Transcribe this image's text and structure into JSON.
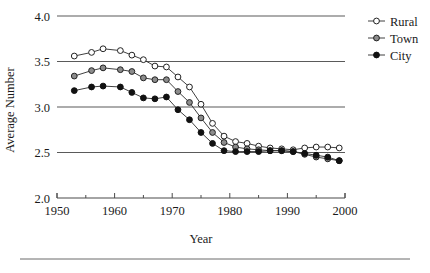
{
  "figure": {
    "y_axis_label": "Average Number",
    "x_axis_label": "Year",
    "y_ticks": [
      "2.0",
      "2.5",
      "3.0",
      "3.5",
      "4.0"
    ],
    "x_ticks": [
      "1950",
      "1960",
      "1970",
      "1980",
      "1990",
      "2000"
    ]
  },
  "legend": {
    "position": "right",
    "entries": [
      {
        "label": "Rural",
        "marker": "open-circle",
        "color": "#ffffff"
      },
      {
        "label": "Town",
        "marker": "gray-circle",
        "color": "#8c8c8c"
      },
      {
        "label": "City",
        "marker": "filled-circle",
        "color": "#111111"
      }
    ]
  },
  "chart_data": {
    "type": "line",
    "title": "",
    "xlabel": "Year",
    "ylabel": "Average Number",
    "xlim": [
      1950,
      2000
    ],
    "ylim": [
      2.0,
      4.0
    ],
    "yticks": [
      2.0,
      2.5,
      3.0,
      3.5,
      4.0
    ],
    "xticks": [
      1950,
      1960,
      1970,
      1980,
      1990,
      2000
    ],
    "xticks_minor": [
      1955,
      1965,
      1975,
      1985,
      1995
    ],
    "grid": "horizontal",
    "legend_position": "right",
    "series": [
      {
        "name": "Rural",
        "marker": "open-circle",
        "x": [
          1953,
          1956,
          1958,
          1961,
          1963,
          1965,
          1967,
          1969,
          1971,
          1973,
          1975,
          1977,
          1979,
          1981,
          1983,
          1985,
          1987,
          1989,
          1991,
          1993,
          1995,
          1997,
          1999
        ],
        "y": [
          3.56,
          3.6,
          3.64,
          3.62,
          3.57,
          3.52,
          3.45,
          3.44,
          3.33,
          3.22,
          3.03,
          2.82,
          2.68,
          2.62,
          2.6,
          2.57,
          2.55,
          2.54,
          2.53,
          2.55,
          2.56,
          2.56,
          2.55
        ]
      },
      {
        "name": "Town",
        "marker": "gray-circle",
        "x": [
          1953,
          1956,
          1958,
          1961,
          1963,
          1965,
          1967,
          1969,
          1971,
          1973,
          1975,
          1977,
          1979,
          1981,
          1983,
          1985,
          1987,
          1989,
          1991,
          1993,
          1995,
          1997,
          1999
        ],
        "y": [
          3.34,
          3.4,
          3.43,
          3.41,
          3.39,
          3.32,
          3.3,
          3.3,
          3.17,
          3.05,
          2.88,
          2.72,
          2.61,
          2.56,
          2.54,
          2.53,
          2.52,
          2.52,
          2.51,
          2.48,
          2.45,
          2.43,
          2.41
        ]
      },
      {
        "name": "City",
        "marker": "filled-circle",
        "x": [
          1953,
          1956,
          1958,
          1961,
          1963,
          1965,
          1967,
          1969,
          1971,
          1973,
          1975,
          1977,
          1979,
          1981,
          1983,
          1985,
          1987,
          1989,
          1991,
          1993,
          1995,
          1997,
          1999
        ],
        "y": [
          3.18,
          3.22,
          3.23,
          3.22,
          3.16,
          3.1,
          3.09,
          3.11,
          2.97,
          2.86,
          2.72,
          2.6,
          2.52,
          2.51,
          2.51,
          2.51,
          2.52,
          2.52,
          2.51,
          2.49,
          2.47,
          2.45,
          2.41
        ]
      }
    ]
  }
}
